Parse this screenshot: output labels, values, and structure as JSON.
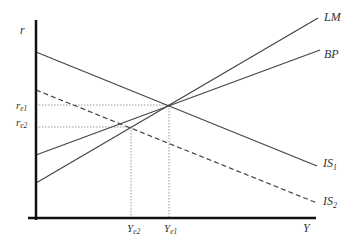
{
  "diagram": {
    "type": "IS-LM-BP",
    "axes": {
      "y_label": "r",
      "x_label": "Y"
    },
    "curves": {
      "LM": {
        "label": "LM",
        "style": "solid"
      },
      "BP": {
        "label": "BP",
        "style": "solid"
      },
      "IS1": {
        "label": "IS",
        "sub": "1",
        "style": "solid"
      },
      "IS2": {
        "label": "IS",
        "sub": "2",
        "style": "dashed"
      }
    },
    "equilibria": {
      "r_e1": {
        "label": "r",
        "sub": "e1"
      },
      "r_e2": {
        "label": "r",
        "sub": "e2"
      },
      "Y_e1": {
        "label": "Y",
        "sub": "e1"
      },
      "Y_e2": {
        "label": "Y",
        "sub": "e2"
      }
    },
    "colors": {
      "axis": "#111111",
      "line": "#444444",
      "guide": "#999999"
    }
  }
}
